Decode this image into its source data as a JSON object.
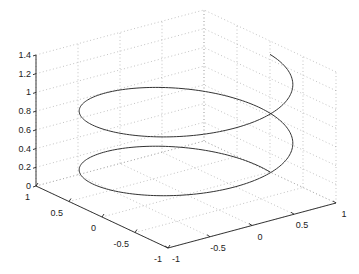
{
  "chart_data": {
    "type": "line3d",
    "title": "",
    "xlabel": "",
    "ylabel": "",
    "zlabel": "",
    "grid": true,
    "legend": null,
    "series": [
      {
        "name": "helix",
        "parametric": {
          "t_range": [
            0,
            12.566
          ],
          "x": "sin(t)",
          "y": "cos(t)",
          "z": "t/10"
        },
        "color": "#333333"
      }
    ],
    "axes": {
      "x": {
        "range": [
          -1,
          1
        ],
        "ticks": [
          -1,
          -0.5,
          0,
          0.5,
          1
        ],
        "tick_labels": [
          "-1",
          "-0.5",
          "0",
          "0.5",
          "1"
        ]
      },
      "y": {
        "range": [
          -1,
          1
        ],
        "ticks": [
          -1,
          -0.5,
          0,
          0.5,
          1
        ],
        "tick_labels": [
          "-1",
          "-0.5",
          "0",
          "0.5",
          "1"
        ]
      },
      "z": {
        "range": [
          0,
          1.4
        ],
        "ticks": [
          0,
          0.2,
          0.4,
          0.6,
          0.8,
          1,
          1.2,
          1.4
        ],
        "tick_labels": [
          "0",
          "0.2",
          "0.4",
          "0.6",
          "0.8",
          "1",
          "1.2",
          "1.4"
        ]
      }
    }
  },
  "projection": {
    "origin": [
      186,
      194.5
    ],
    "x_unit": [
      -66,
      -31
    ],
    "y_unit": [
      84,
      -22.5
    ],
    "z_unit": 93.6
  },
  "colors": {
    "axis": "#222222",
    "grid": "#9a9a9a",
    "line": "#333333",
    "background": "#ffffff"
  }
}
